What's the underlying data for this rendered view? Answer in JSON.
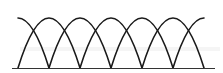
{
  "diagram": {
    "stroke_color": "#1a1a1a",
    "baseline_color": "#333333",
    "baseline": {
      "x1": 12,
      "x2": 215,
      "y": 68.5
    },
    "peak_y": 18,
    "foot_y": 68,
    "feet_x": [
      18,
      49,
      80,
      111,
      142,
      173,
      204
    ],
    "arches": [
      {
        "from": 18,
        "to": 80
      },
      {
        "from": 49,
        "to": 111
      },
      {
        "from": 80,
        "to": 142
      },
      {
        "from": 111,
        "to": 173
      },
      {
        "from": 142,
        "to": 204
      }
    ],
    "half_arches": [
      {
        "side": "left",
        "top_x": 18,
        "foot_x": 49
      },
      {
        "side": "right",
        "foot_x": 173,
        "top_x": 204
      }
    ]
  }
}
